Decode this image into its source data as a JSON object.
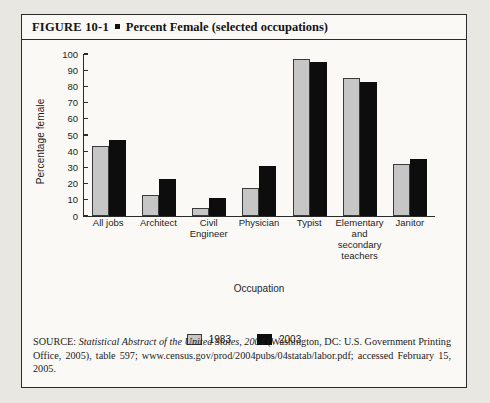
{
  "figure": {
    "label": "FIGURE 10-1",
    "title": "Percent Female (selected occupations)"
  },
  "source": {
    "prefix": "SOURCE: ",
    "italic_title": "Statistical Abstract of the United States, 2004",
    "rest": " (Washington, DC: U.S. Government Printing Office, 2005), table 597; www.census.gov/prod/2004pubs/04statab/labor.pdf; accessed February 15, 2005."
  },
  "chart_data": {
    "type": "bar",
    "title": "Percent Female (selected occupations)",
    "xlabel": "Occupation",
    "ylabel": "Percentage female",
    "ylim": [
      0,
      100
    ],
    "yticks": [
      0,
      10,
      20,
      30,
      40,
      50,
      60,
      70,
      80,
      90,
      100
    ],
    "grid": false,
    "legend_position": "bottom",
    "categories": [
      "All jobs",
      "Architect",
      "Civil Engineer",
      "Physician",
      "Typist",
      "Elementary and secondary teachers",
      "Janitor"
    ],
    "category_lines": [
      [
        "All jobs"
      ],
      [
        "Architect"
      ],
      [
        "Civil",
        "Engineer"
      ],
      [
        "Physician"
      ],
      [
        "Typist"
      ],
      [
        "Elementary",
        "and",
        "secondary",
        "teachers"
      ],
      [
        "Janitor"
      ]
    ],
    "series": [
      {
        "name": "1983",
        "color": "#c6c6c6",
        "values": [
          43,
          13,
          5,
          17,
          97,
          85,
          32
        ]
      },
      {
        "name": "2003",
        "color": "#0d0d0d",
        "values": [
          47,
          23,
          11,
          31,
          95,
          83,
          35
        ]
      }
    ]
  }
}
